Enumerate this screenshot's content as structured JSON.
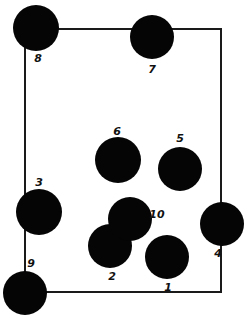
{
  "diagram": {
    "type": "numbered-discs-in-rectangle",
    "background": "#ffffff",
    "ink_color": "#050505",
    "frame": {
      "left": 25,
      "top": 29,
      "right": 221,
      "bottom": 292,
      "stroke": "#1a1a1a"
    },
    "discs": [
      {
        "id": "1",
        "label": "1",
        "cx": 167,
        "cy": 257,
        "r": 22,
        "label_x": 168,
        "label_y": 287
      },
      {
        "id": "2",
        "label": "2",
        "cx": 110,
        "cy": 246,
        "r": 22,
        "label_x": 112,
        "label_y": 276
      },
      {
        "id": "3",
        "label": "3",
        "cx": 39,
        "cy": 212,
        "r": 23,
        "label_x": 39,
        "label_y": 182
      },
      {
        "id": "4",
        "label": "4",
        "cx": 222,
        "cy": 224,
        "r": 22,
        "label_x": 218,
        "label_y": 253
      },
      {
        "id": "5",
        "label": "5",
        "cx": 180,
        "cy": 169,
        "r": 22,
        "label_x": 180,
        "label_y": 138
      },
      {
        "id": "6",
        "label": "6",
        "cx": 118,
        "cy": 160,
        "r": 23,
        "label_x": 117,
        "label_y": 131
      },
      {
        "id": "7",
        "label": "7",
        "cx": 152,
        "cy": 37,
        "r": 22,
        "label_x": 152,
        "label_y": 69
      },
      {
        "id": "8",
        "label": "8",
        "cx": 36,
        "cy": 28,
        "r": 23,
        "label_x": 38,
        "label_y": 58
      },
      {
        "id": "9",
        "label": "9",
        "cx": 25,
        "cy": 293,
        "r": 22,
        "label_x": 31,
        "label_y": 263
      },
      {
        "id": "10",
        "label": "10",
        "cx": 130,
        "cy": 219,
        "r": 22,
        "label_x": 157,
        "label_y": 214
      }
    ]
  }
}
